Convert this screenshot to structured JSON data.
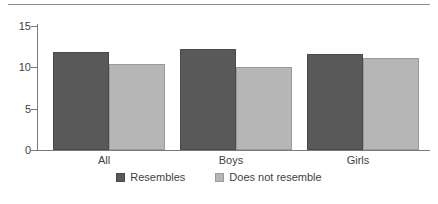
{
  "chart_data": {
    "type": "bar",
    "title": "",
    "subtitle": "",
    "xlabel": "",
    "ylabel": "",
    "categories": [
      "All",
      "Boys",
      "Girls"
    ],
    "series": [
      {
        "name": "Resembles",
        "values": [
          11.9,
          12.2,
          11.6
        ],
        "color": "#595959"
      },
      {
        "name": "Does not resemble",
        "values": [
          10.4,
          10.1,
          11.1
        ],
        "color": "#b6b6b6"
      }
    ],
    "ylim": [
      0,
      16
    ],
    "yticks": [
      0,
      5,
      10,
      15
    ],
    "ytick_labels": [
      "0",
      "5",
      "10",
      "15"
    ],
    "grid": false,
    "legend_position": "bottom"
  },
  "axis": {
    "y_labels": [
      "15",
      "10",
      "5",
      "0"
    ]
  },
  "legend": {
    "items": [
      {
        "label": "Resembles"
      },
      {
        "label": "Does not resemble"
      }
    ]
  }
}
